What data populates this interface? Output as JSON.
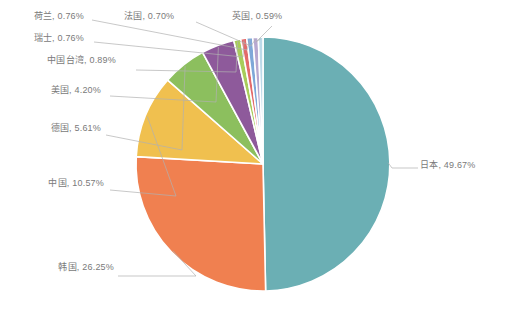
{
  "chart_data": {
    "type": "pie",
    "title": "",
    "subtitle": "",
    "xlabel": "",
    "ylabel": "",
    "legend_position": "none",
    "grid": false,
    "label_format": "{name}, {value}%",
    "categories": [
      "日本",
      "韩国",
      "中国",
      "德国",
      "美国",
      "中国台湾",
      "瑞士",
      "荷兰",
      "法国",
      "英国"
    ],
    "values": [
      49.67,
      26.25,
      10.57,
      5.61,
      4.2,
      0.89,
      0.76,
      0.76,
      0.7,
      0.59
    ],
    "colors": [
      "#6bafb4",
      "#f08050",
      "#f0c04f",
      "#8cbf5e",
      "#8e5a9b",
      "#a8cc5a",
      "#e36a6a",
      "#7fa8d8",
      "#b7a8d0",
      "#bcd9e8"
    ],
    "slices": [
      {
        "name": "日本",
        "value": 49.67,
        "color": "#6bafb4",
        "label": "日本, 49.67%"
      },
      {
        "name": "韩国",
        "value": 26.25,
        "color": "#f08050",
        "label": "韩国, 26.25%"
      },
      {
        "name": "中国",
        "value": 10.57,
        "color": "#f0c04f",
        "label": "中国, 10.57%"
      },
      {
        "name": "德国",
        "value": 5.61,
        "color": "#8cbf5e",
        "label": "德国, 5.61%"
      },
      {
        "name": "美国",
        "value": 4.2,
        "color": "#8e5a9b",
        "label": "美国, 4.20%"
      },
      {
        "name": "中国台湾",
        "value": 0.89,
        "color": "#a8cc5a",
        "label": "中国台湾, 0.89%"
      },
      {
        "name": "瑞士",
        "value": 0.76,
        "color": "#e36a6a",
        "label": "瑞士, 0.76%"
      },
      {
        "name": "荷兰",
        "value": 0.76,
        "color": "#7fa8d8",
        "label": "荷兰, 0.76%"
      },
      {
        "name": "法国",
        "value": 0.7,
        "color": "#b7a8d0",
        "label": "法国, 0.70%"
      },
      {
        "name": "英国",
        "value": 0.59,
        "color": "#bcd9e8",
        "label": "英国, 0.59%"
      }
    ]
  },
  "labels": {
    "japan": "日本, 49.67%",
    "korea": "韩国, 26.25%",
    "china": "中国, 10.57%",
    "germany": "德国, 5.61%",
    "usa": "美国, 4.20%",
    "taiwan": "中国台湾, 0.89%",
    "switzerland": "瑞士, 0.76%",
    "netherlands": "荷兰, 0.76%",
    "france": "法国, 0.70%",
    "uk": "英国, 0.59%"
  },
  "style": {
    "background": "#ffffff",
    "label_color": "#7a7a7a",
    "leader_color": "#b0b0b0",
    "slice_gap_color": "#ffffff"
  }
}
